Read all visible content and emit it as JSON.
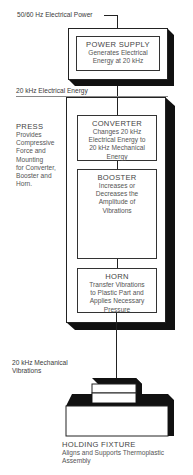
{
  "input_label": "50/60 Hz Electrical Power",
  "power_supply": {
    "title": "POWER SUPPLY",
    "desc_lines": [
      "Generates Electrical",
      "Energy at 20 kHz"
    ]
  },
  "electrical_label": "20 kHz Electrical Energy",
  "press": {
    "title": "PRESS",
    "desc_lines": [
      "Provides",
      "Compressive",
      "Force and",
      "Mounting",
      "for Converter,",
      "Booster and",
      "Horn."
    ]
  },
  "converter": {
    "title": "CONVERTER",
    "desc_lines": [
      "Changes 20 kHz",
      "Electrical Energy to",
      "20 kHz Mechanical",
      "Energy"
    ]
  },
  "booster": {
    "title": "BOOSTER",
    "desc_lines": [
      "Increases or",
      "Decreases the",
      "Amplitude of",
      "Vibrations"
    ]
  },
  "horn": {
    "title": "HORN",
    "desc_lines": [
      "Transfer Vibrations",
      "to Plastic Part and",
      "Applies Necessary",
      "Pressure"
    ]
  },
  "mechanical_label_lines": [
    "20 kHz Mechanical",
    "Vibrations"
  ],
  "holding_fixture": {
    "title": "HOLDING FIXTURE",
    "desc_lines": [
      "Aligns and Supports Thermoplastic",
      "Assembly"
    ]
  }
}
